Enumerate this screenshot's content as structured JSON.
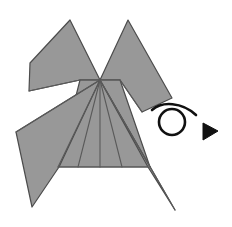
{
  "figure": {
    "type": "origami-instruction-diagram",
    "canvas": {
      "width": 232,
      "height": 227,
      "background": "#ffffff"
    },
    "colors": {
      "paper_fill": "#989898",
      "paper_fill_shadow": "#8f8f8f",
      "outline": "#4c4c4c",
      "crease": "#5a5a5a",
      "arrow": "#111111",
      "background": "#ffffff"
    },
    "stroke_widths": {
      "outline": 1.2,
      "crease": 1.1,
      "arrow": 2.6
    },
    "model_name": "Paper model with four points and a central body",
    "apex_point": {
      "x": 100,
      "y": 80
    },
    "shapes": {
      "left_upper_flap": {
        "name": "left-upper-flap",
        "points": "70,20 100,80 80,80 29,91 30,63"
      },
      "right_upper_flap": {
        "name": "right-upper-flap",
        "points": "128,20 172,98 142,112 120,80 100,80"
      },
      "left_lower_wing": {
        "name": "left-lower-wing",
        "points": "100,80 59,167 32,207 16,132"
      },
      "right_lower_wing": {
        "name": "right-lower-wing",
        "points": "100,80 175,210 148,167"
      },
      "central_body": {
        "name": "central-body-panel",
        "points": "80,80 120,80 150,167 58,167"
      }
    },
    "creases": [
      {
        "name": "crease-apex-to-left-outer",
        "d": "M100,80 L16,132"
      },
      {
        "name": "crease-apex-to-left-body-corner",
        "d": "M100,80 L58,167"
      },
      {
        "name": "crease-apex-to-left-mid",
        "d": "M100,80 L78,167"
      },
      {
        "name": "crease-apex-center-vertical",
        "d": "M100,80 L100,167"
      },
      {
        "name": "crease-apex-to-right-mid",
        "d": "M100,80 L122,167"
      },
      {
        "name": "crease-apex-to-right-body-corner",
        "d": "M100,80 L150,167"
      },
      {
        "name": "crease-apex-to-right-outer",
        "d": "M100,80 L175,210"
      },
      {
        "name": "crease-horizontal-top",
        "d": "M80,80 L120,80"
      },
      {
        "name": "crease-body-bottom",
        "d": "M58,167 L150,167"
      },
      {
        "name": "crease-left-flap-inner",
        "d": "M100,80 L80,80"
      },
      {
        "name": "crease-right-flap-inner",
        "d": "M100,80 L120,80"
      },
      {
        "name": "crease-left-flap-edge",
        "d": "M80,80 L29,91"
      },
      {
        "name": "crease-right-flap-edge",
        "d": "M120,80 L142,112"
      }
    ],
    "arrow": {
      "name": "twist-fold-arrow",
      "label": "curl-and-flip arrow",
      "tail_path": "M152,110 C162,101 182,102 196,115",
      "loop": {
        "cx": 172,
        "cy": 122,
        "rx": 13,
        "ry": 13
      },
      "head_points": "218,131 203,123 203,140",
      "direction": "right"
    }
  }
}
